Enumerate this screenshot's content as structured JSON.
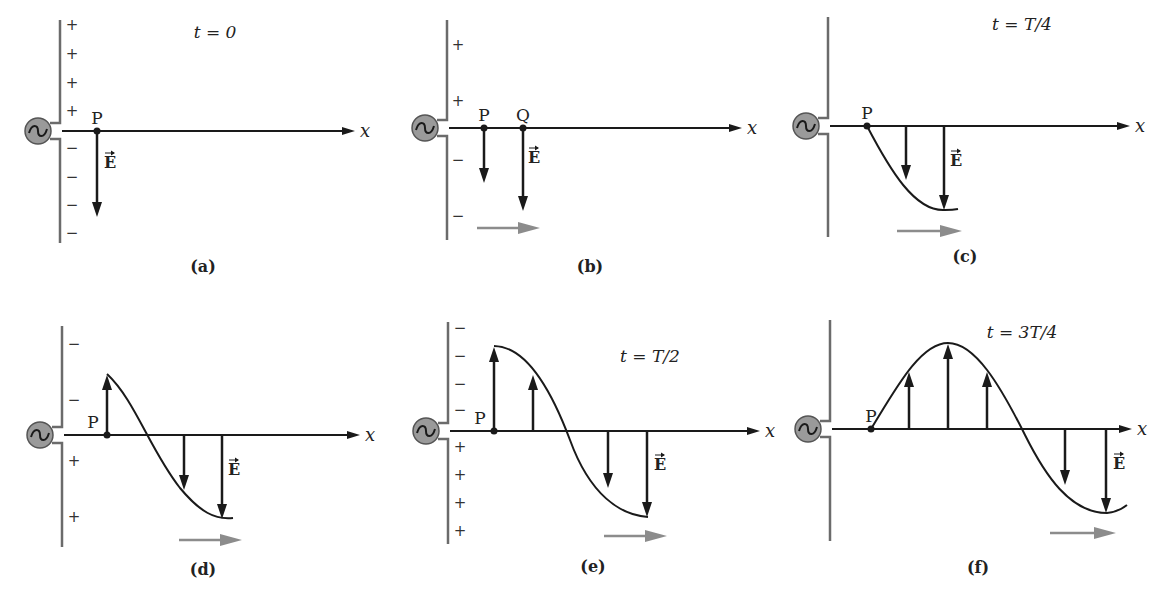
{
  "figure": {
    "colors": {
      "ink": "#1a1a1a",
      "antenna": "#6b6b6b",
      "generator_fill": "#9a9a9a",
      "propagation_arrow": "#8c8c8c"
    },
    "axis_label": "x",
    "field_label": "E",
    "generator_icon": "ac-source-icon",
    "panels": [
      {
        "id": "a",
        "caption": "(a)",
        "time_label": "t = 0",
        "ox": 60,
        "oy": 131,
        "ant_top": 20,
        "ant_bottom": 243,
        "axis_end": 355,
        "time_pos": [
          215,
          38
        ],
        "signs": [
          {
            "s": "+",
            "x": 72,
            "y": 30
          },
          {
            "s": "+",
            "x": 72,
            "y": 59
          },
          {
            "s": "+",
            "x": 72,
            "y": 88
          },
          {
            "s": "+",
            "x": 72,
            "y": 116
          },
          {
            "s": "−",
            "x": 72,
            "y": 153
          },
          {
            "s": "−",
            "x": 72,
            "y": 182
          },
          {
            "s": "−",
            "x": 72,
            "y": 210
          },
          {
            "s": "−",
            "x": 72,
            "y": 238
          }
        ],
        "points": [
          {
            "name": "P",
            "x": 97,
            "y": 131
          }
        ],
        "curve": null,
        "arrows": [
          {
            "x": 97,
            "y2": 217
          }
        ],
        "e_label": [
          104,
          168
        ],
        "prop_arrow": null,
        "caption_pos": [
          203,
          272
        ]
      },
      {
        "id": "b",
        "caption": "(b)",
        "time_label": "",
        "ox": 447,
        "oy": 128,
        "ant_top": 20,
        "ant_bottom": 240,
        "axis_end": 742,
        "time_pos": null,
        "signs": [
          {
            "s": "+",
            "x": 458,
            "y": 50
          },
          {
            "s": "+",
            "x": 458,
            "y": 106
          },
          {
            "s": "−",
            "x": 458,
            "y": 165
          },
          {
            "s": "−",
            "x": 458,
            "y": 221
          }
        ],
        "points": [
          {
            "name": "P",
            "x": 484,
            "y": 128
          },
          {
            "name": "Q",
            "x": 523,
            "y": 128
          }
        ],
        "curve": null,
        "arrows": [
          {
            "x": 484,
            "y2": 183
          },
          {
            "x": 523,
            "y2": 211
          }
        ],
        "e_label": [
          528,
          163
        ],
        "prop_arrow": [
          477,
          228,
          540
        ],
        "caption_pos": [
          590,
          272
        ]
      },
      {
        "id": "c",
        "caption": "(c)",
        "time_label": "t = T/4",
        "ox": 828,
        "oy": 126,
        "ant_top": 17,
        "ant_bottom": 237,
        "axis_end": 1130,
        "time_pos": [
          1022,
          30
        ],
        "signs": [],
        "points": [
          {
            "name": "P",
            "x": 867,
            "y": 126
          }
        ],
        "curve": "M867,126 C890,170 915,212 945,210 Q953,210 958,209",
        "arrows": [
          {
            "x": 906,
            "y2": 180
          },
          {
            "x": 944,
            "y2": 210
          }
        ],
        "e_label": [
          950,
          166
        ],
        "prop_arrow": [
          897,
          231,
          962
        ],
        "caption_pos": [
          965,
          262
        ]
      },
      {
        "id": "d",
        "caption": "(d)",
        "time_label": "",
        "ox": 62,
        "oy": 435,
        "ant_top": 326,
        "ant_bottom": 547,
        "axis_end": 360,
        "time_pos": null,
        "signs": [
          {
            "s": "−",
            "x": 74,
            "y": 349
          },
          {
            "s": "−",
            "x": 74,
            "y": 405
          },
          {
            "s": "+",
            "x": 74,
            "y": 466
          },
          {
            "s": "+",
            "x": 74,
            "y": 522
          }
        ],
        "points": [
          {
            "name": "P",
            "x": 107,
            "y": 435
          }
        ],
        "curve": "M107,374 C135,400 150,450 180,488 C200,512 215,520 233,518",
        "arrows": [
          {
            "x": 107,
            "y2": 375,
            "up": true
          },
          {
            "x": 184,
            "y2": 490
          },
          {
            "x": 222,
            "y2": 519
          }
        ],
        "e_label": [
          228,
          475
        ],
        "prop_arrow": [
          179,
          540,
          242
        ],
        "caption_pos": [
          203,
          575
        ]
      },
      {
        "id": "e",
        "caption": "(e)",
        "time_label": "t = T/2",
        "ox": 448,
        "oy": 431,
        "ant_top": 322,
        "ant_bottom": 544,
        "axis_end": 760,
        "time_pos": [
          650,
          362
        ],
        "signs": [
          {
            "s": "−",
            "x": 460,
            "y": 333
          },
          {
            "s": "−",
            "x": 460,
            "y": 361
          },
          {
            "s": "−",
            "x": 460,
            "y": 389
          },
          {
            "s": "−",
            "x": 460,
            "y": 415
          },
          {
            "s": "+",
            "x": 460,
            "y": 452
          },
          {
            "s": "+",
            "x": 460,
            "y": 480
          },
          {
            "s": "+",
            "x": 460,
            "y": 508
          },
          {
            "s": "+",
            "x": 460,
            "y": 536
          }
        ],
        "points": [
          {
            "name": "P",
            "x": 494,
            "y": 431
          }
        ],
        "curve": "M494,346 C530,346 555,400 570,440 C590,495 620,515 648,517",
        "arrows": [
          {
            "x": 494,
            "y2": 347,
            "up": true
          },
          {
            "x": 533,
            "y2": 375,
            "up": true
          },
          {
            "x": 608,
            "y2": 488
          },
          {
            "x": 647,
            "y2": 517
          }
        ],
        "e_label": [
          654,
          470
        ],
        "prop_arrow": [
          604,
          536,
          667
        ],
        "caption_pos": [
          593,
          572
        ]
      },
      {
        "id": "f",
        "caption": "(f)",
        "time_label": "t = 3T/4",
        "ox": 830,
        "oy": 429,
        "ant_top": 320,
        "ant_bottom": 541,
        "axis_end": 1132,
        "time_pos": [
          1022,
          338
        ],
        "signs": [],
        "points": [
          {
            "name": "P",
            "x": 871,
            "y": 429
          }
        ],
        "curve": "M871,429 C895,390 920,343 948,343 C975,343 1000,385 1025,435 C1045,475 1070,513 1107,513 Q1118,512 1127,505",
        "arrows": [
          {
            "x": 909,
            "y2": 372,
            "up": true
          },
          {
            "x": 948,
            "y2": 344,
            "up": true
          },
          {
            "x": 987,
            "y2": 372,
            "up": true
          },
          {
            "x": 1065,
            "y2": 485
          },
          {
            "x": 1106,
            "y2": 513
          }
        ],
        "e_label": [
          1113,
          469
        ],
        "prop_arrow": [
          1050,
          533,
          1116
        ],
        "caption_pos": [
          978,
          573
        ]
      }
    ]
  }
}
